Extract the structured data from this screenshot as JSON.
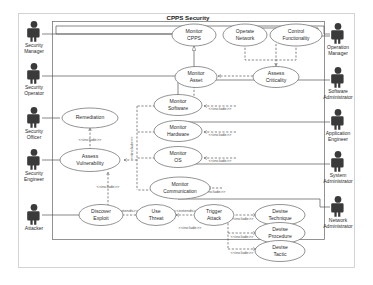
{
  "diagram": {
    "kind": "uml-use-case-diagram",
    "system_title": "CPPS Security",
    "actors_left": [
      {
        "id": "security-manager",
        "label_line1": "Security",
        "label_line2": "Manager"
      },
      {
        "id": "security-operator",
        "label_line1": "Security",
        "label_line2": "Operator"
      },
      {
        "id": "security-officer",
        "label_line1": "Security",
        "label_line2": "Officer"
      },
      {
        "id": "security-engineer",
        "label_line1": "Security",
        "label_line2": "Engineer"
      },
      {
        "id": "attacker",
        "label_line1": "Attacker",
        "label_line2": ""
      }
    ],
    "actors_right": [
      {
        "id": "operation-manager",
        "label_line1": "Operation",
        "label_line2": "Manager"
      },
      {
        "id": "software-administrator",
        "label_line1": "Software",
        "label_line2": "Administrator"
      },
      {
        "id": "application-engineer",
        "label_line1": "Application",
        "label_line2": "Engineer"
      },
      {
        "id": "system-administrator",
        "label_line1": "System",
        "label_line2": "Administrator"
      },
      {
        "id": "network-administrator",
        "label_line1": "Network",
        "label_line2": "Administrator"
      }
    ],
    "use_cases": [
      {
        "id": "monitor-cpps",
        "line1": "Monitor",
        "line2": "CPPS"
      },
      {
        "id": "operate-network",
        "line1": "Operate",
        "line2": "Network"
      },
      {
        "id": "control-functionality",
        "line1": "Control",
        "line2": "Functionality"
      },
      {
        "id": "monitor-asset",
        "line1": "Monitor",
        "line2": "Asset"
      },
      {
        "id": "assess-criticality",
        "line1": "Assess",
        "line2": "Criticality"
      },
      {
        "id": "remediation",
        "line1": "Remediation",
        "line2": ""
      },
      {
        "id": "assess-vulnerability",
        "line1": "Assess",
        "line2": "Vulnerability"
      },
      {
        "id": "monitor-software",
        "line1": "Monitor",
        "line2": "Software"
      },
      {
        "id": "monitor-hardware",
        "line1": "Monitor",
        "line2": "Hardware"
      },
      {
        "id": "monitor-os",
        "line1": "Monitor",
        "line2": "OS"
      },
      {
        "id": "monitor-communication",
        "line1": "Monitor",
        "line2": "Communication"
      },
      {
        "id": "discover-exploit",
        "line1": "Discover",
        "line2": "Exploit"
      },
      {
        "id": "use-threat",
        "line1": "Use",
        "line2": "Threat"
      },
      {
        "id": "trigger-attack",
        "line1": "Trigger",
        "line2": "Attack"
      },
      {
        "id": "devise-technique",
        "line1": "Devise",
        "line2": "Technique"
      },
      {
        "id": "devise-procedure",
        "line1": "Devise",
        "line2": "Procedure"
      },
      {
        "id": "devise-tactic",
        "line1": "Devise",
        "line2": "Tactic"
      }
    ],
    "stereotypes": {
      "include": "<<include>>",
      "extend": "<<extends>>"
    },
    "relationships": [
      {
        "from": "security-manager",
        "to": "monitor-cpps",
        "type": "association"
      },
      {
        "from": "security-operator",
        "to": "monitor-asset",
        "type": "association"
      },
      {
        "from": "monitor-asset",
        "to": "monitor-cpps",
        "type": "generalization"
      },
      {
        "from": "operation-manager",
        "to": "control-functionality",
        "type": "association"
      },
      {
        "from": "operation-manager",
        "to": "monitor-cpps",
        "type": "association"
      },
      {
        "from": "assess-criticality",
        "to": "monitor-asset",
        "type": "include",
        "label": "<<include>>"
      },
      {
        "from": "operate-network",
        "to": "assess-criticality",
        "type": "include"
      },
      {
        "from": "control-functionality",
        "to": "assess-criticality",
        "type": "include"
      },
      {
        "from": "security-officer",
        "to": "remediation",
        "type": "association"
      },
      {
        "from": "security-engineer",
        "to": "assess-vulnerability",
        "type": "association"
      },
      {
        "from": "remediation",
        "to": "assess-vulnerability",
        "type": "include",
        "label": "<<include>>"
      },
      {
        "from": "assess-vulnerability",
        "to": "discover-exploit",
        "type": "include",
        "label": "<<include>>"
      },
      {
        "from": "monitor-software",
        "to": "assess-vulnerability",
        "type": "include",
        "label": "<<include>>"
      },
      {
        "from": "monitor-hardware",
        "to": "assess-vulnerability",
        "type": "include",
        "label": "<<include>>"
      },
      {
        "from": "monitor-os",
        "to": "assess-vulnerability",
        "type": "include",
        "label": "<<include>>"
      },
      {
        "from": "monitor-communication",
        "to": "assess-vulnerability",
        "type": "include",
        "label": "<<include>>"
      },
      {
        "from": "software-administrator",
        "to": "monitor-software",
        "type": "association"
      },
      {
        "from": "application-engineer",
        "to": "monitor-hardware",
        "type": "association"
      },
      {
        "from": "system-administrator",
        "to": "monitor-os",
        "type": "association"
      },
      {
        "from": "network-administrator",
        "to": "monitor-communication",
        "type": "association"
      },
      {
        "from": "attacker",
        "to": "discover-exploit",
        "type": "association"
      },
      {
        "from": "use-threat",
        "to": "discover-exploit",
        "type": "extend",
        "label": "<<extends>>"
      },
      {
        "from": "trigger-attack",
        "to": "use-threat",
        "type": "extend",
        "label": "<<extends>>"
      },
      {
        "from": "trigger-attack",
        "to": "devise-technique",
        "type": "include",
        "label": "<<include>>"
      },
      {
        "from": "trigger-attack",
        "to": "devise-procedure",
        "type": "include",
        "label": "<<include>>"
      },
      {
        "from": "trigger-attack",
        "to": "devise-tactic",
        "type": "include",
        "label": "<<include>>"
      }
    ]
  }
}
